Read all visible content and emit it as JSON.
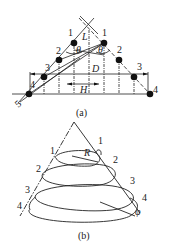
{
  "figure_a": {
    "caption": "(a)",
    "point_labels_left": [
      "1",
      "2",
      "3",
      "4"
    ],
    "point_labels_right": [
      "1",
      "2",
      "3",
      "4"
    ],
    "extra_label": "5",
    "dimensions": {
      "L": "L",
      "D": "D",
      "H": "H"
    },
    "angles": {
      "theta_left": "θ",
      "theta_right": "θ"
    }
  },
  "figure_b": {
    "caption": "(b)",
    "point_labels_left": [
      "1",
      "2",
      "3",
      "4"
    ],
    "point_labels_right": [
      "1",
      "2",
      "3",
      "4"
    ],
    "radius_label": "R",
    "angle_label": "φ"
  },
  "colors": {
    "ink": "#222222",
    "background": "#ffffff"
  }
}
